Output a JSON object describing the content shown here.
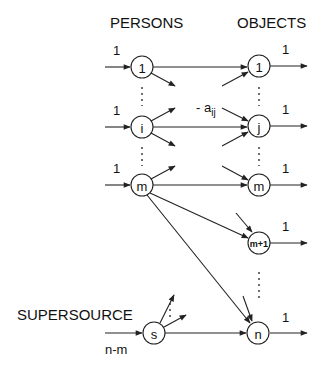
{
  "diagram": {
    "headers": {
      "persons": "PERSONS",
      "objects": "OBJECTS",
      "supersource": "SUPERSOURCE"
    },
    "persons": [
      {
        "id": "p1",
        "label": "1",
        "supply": "1"
      },
      {
        "id": "pi",
        "label": "i",
        "supply": "1"
      },
      {
        "id": "pm",
        "label": "m",
        "supply": "1"
      }
    ],
    "objects": [
      {
        "id": "o1",
        "label": "1",
        "demand": "1"
      },
      {
        "id": "oj",
        "label": "j",
        "demand": "1"
      },
      {
        "id": "om",
        "label": "m",
        "demand": "1"
      },
      {
        "id": "om1",
        "label": "m+1",
        "demand": "1"
      },
      {
        "id": "on",
        "label": "n",
        "demand": "1"
      }
    ],
    "supersource": {
      "id": "s",
      "label": "s",
      "supply": "n-m"
    },
    "edge_cost_label": "- a",
    "edge_cost_subscript": "ij",
    "colors": {
      "line": "#222222",
      "background": "#ffffff"
    }
  }
}
